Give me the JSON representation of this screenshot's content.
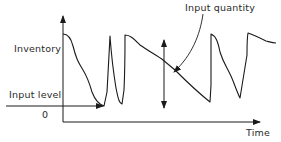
{
  "diagram": {
    "labels": {
      "y_axis": "Inventory",
      "input_level": "Input level",
      "zero": "0",
      "input_quantity": "Input quantity",
      "x_axis": "Time"
    },
    "colors": {
      "line": "#1a1a1a",
      "text": "#2a2a2a",
      "background": "#ffffff"
    }
  }
}
